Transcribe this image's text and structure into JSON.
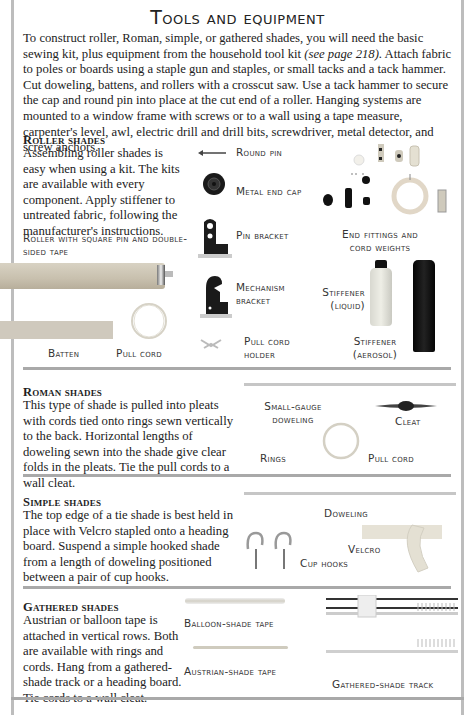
{
  "page": {
    "title": "Tools and equipment",
    "intro": {
      "before_ref": "To construct roller, Roman, simple, or gathered shades, you will need the basic sewing kit, plus equipment from the household tool kit ",
      "ref": "(see page 218).",
      "after_ref": " Attach fabric to poles or boards using a staple gun and staples, or small tacks and a tack hammer. Cut doweling, battens, and rollers with a crosscut saw. Use a tack hammer to secure the cap and round pin into place at the cut end of a roller. Hanging systems are mounted to a window frame with screws or to a wall using a tape measure, carpenter's level, awl, electric drill and drill bits, screwdriver, metal detector, and screw anchors."
    }
  },
  "sections": {
    "roller": {
      "heading": "Roller shades",
      "body": "Assembling roller shades is easy when using a kit. The kits are available with every component. Apply stiffener to untreated fabric, following the manufacturer's instructions.",
      "captions": {
        "roller": "Roller with square pin and double-sided tape",
        "round_pin": "Round pin",
        "metal_end_cap": "Metal end cap",
        "pin_bracket": "Pin bracket",
        "end_fittings_1": "End fittings and",
        "end_fittings_2": "cord weights",
        "mechanism_1": "Mechanism",
        "mechanism_2": "bracket",
        "stiffener_liquid_1": "Stiffener",
        "stiffener_liquid_2": "(liquid)",
        "pull_cord_holder_1": "Pull cord",
        "pull_cord_holder_2": "holder",
        "stiffener_aerosol_1": "Stiffener",
        "stiffener_aerosol_2": "(aerosol)",
        "batten": "Batten",
        "pull_cord": "Pull cord"
      }
    },
    "roman": {
      "heading": "Roman shades",
      "body": "This type of shade is pulled into pleats with cords tied onto rings sewn vertically to the back. Horizontal lengths of doweling sewn into the shade give clear folds in the pleats. Tie the pull cords to a wall cleat.",
      "captions": {
        "doweling_1": "Small-gauge",
        "doweling_2": "doweling",
        "cleat": "Cleat",
        "rings": "Rings",
        "pull_cord": "Pull cord"
      }
    },
    "simple": {
      "heading": "Simple shades",
      "body": "The top edge of a tie shade is best held in place with Velcro stapled onto a heading board. Suspend a simple hooked shade from a length of doweling positioned between a pair of cup hooks.",
      "captions": {
        "doweling": "Doweling",
        "velcro": "Velcro",
        "cup_hooks": "Cup hooks"
      }
    },
    "gathered": {
      "heading": "Gathered shades",
      "body": "Austrian or balloon tape is attached in vertical rows. Both are available with rings and cords. Hang from a gathered-shade track or a heading board. Tie cords to a wall cleat.",
      "captions": {
        "balloon_tape": "Balloon-shade tape",
        "austrian_tape": "Austrian-shade tape",
        "track": "Gathered-shade track"
      }
    }
  }
}
